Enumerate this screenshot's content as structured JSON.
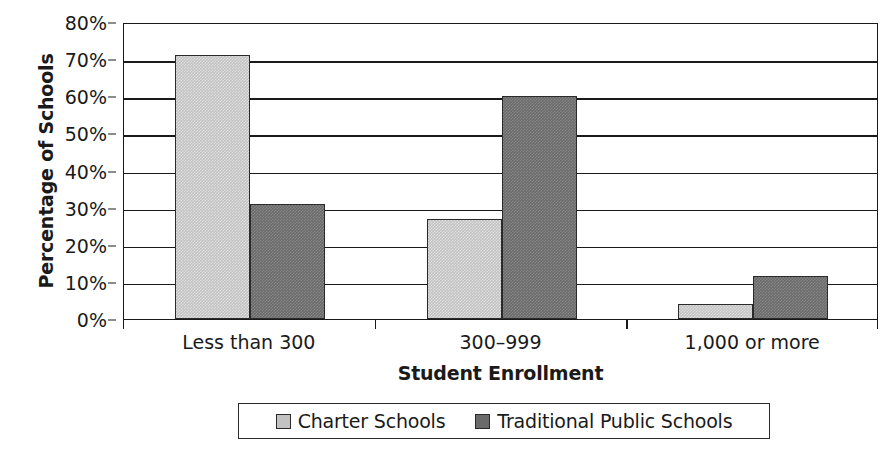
{
  "chart_data": {
    "type": "bar",
    "title": "",
    "xlabel": "Student Enrollment",
    "ylabel": "Percentage of Schools",
    "categories": [
      "Less than 300",
      "300–999",
      "1,000 or more"
    ],
    "series": [
      {
        "name": "Charter Schools",
        "color": "#c2c2c2",
        "values": [
          71,
          27,
          4
        ]
      },
      {
        "name": "Traditional Public Schools",
        "color": "#6b6b6b",
        "values": [
          31,
          60,
          11.5
        ]
      }
    ],
    "ylim": [
      0,
      80
    ],
    "ytick_values": [
      0,
      10,
      20,
      30,
      40,
      50,
      60,
      70,
      80
    ],
    "ytick_labels": [
      "0%",
      "10%",
      "20%",
      "30%",
      "40%",
      "50%",
      "60%",
      "70%",
      "80%"
    ],
    "grid": true,
    "legend_position": "bottom"
  },
  "legend": {
    "items": [
      {
        "label": "Charter Schools"
      },
      {
        "label": "Traditional Public Schools"
      }
    ]
  }
}
